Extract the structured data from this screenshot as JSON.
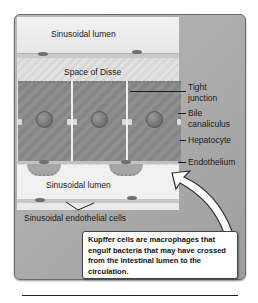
{
  "diagram": {
    "regions": {
      "top_lumen": "Sinusoidal lumen",
      "space_of_disse": "Space of Disse",
      "bottom_lumen": "Sinusoidal lumen"
    },
    "labels": {
      "tight_junction_line1": "Tight",
      "tight_junction_line2": "junction",
      "bile_line1": "Bile",
      "bile_line2": "canaliculus",
      "hepatocyte": "Hepatocyte",
      "endothelium": "Endothelium",
      "endothelial_cells": "Sinusoidal endothelial cells"
    },
    "callout": {
      "text": "Kupffer cells are macrophages that engulf bacteria that may have crossed from the intestinal lumen to the circulation."
    },
    "colors": {
      "panel_bg": "#a9a9a9",
      "tissue_bg": "#e9e9e9",
      "hepatocyte": "#8a8a8a",
      "callout_bg": "#ffffff"
    }
  }
}
